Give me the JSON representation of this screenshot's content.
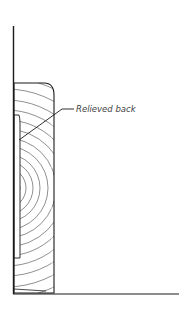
{
  "diagram": {
    "labels": {
      "relieved_back": "Relieved back"
    },
    "colors": {
      "line": "#1a1a1a",
      "grain": "#333333",
      "label": "#444444",
      "background": "#ffffff"
    },
    "parts": [
      "wall",
      "floor",
      "baseboard",
      "relief-cut",
      "leader-line"
    ]
  }
}
